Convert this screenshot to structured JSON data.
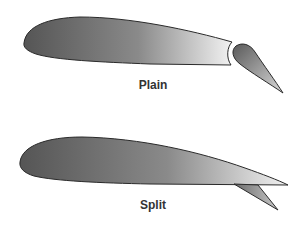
{
  "diagram": {
    "flaps": [
      {
        "name": "plain",
        "label": "Plain"
      },
      {
        "name": "split",
        "label": "Split"
      }
    ]
  },
  "colors": {
    "background": "#ffffff",
    "outline": "#2a2a2a",
    "gradient_dark": "#555555",
    "gradient_light": "#f2f2f2",
    "label": "#333333"
  }
}
